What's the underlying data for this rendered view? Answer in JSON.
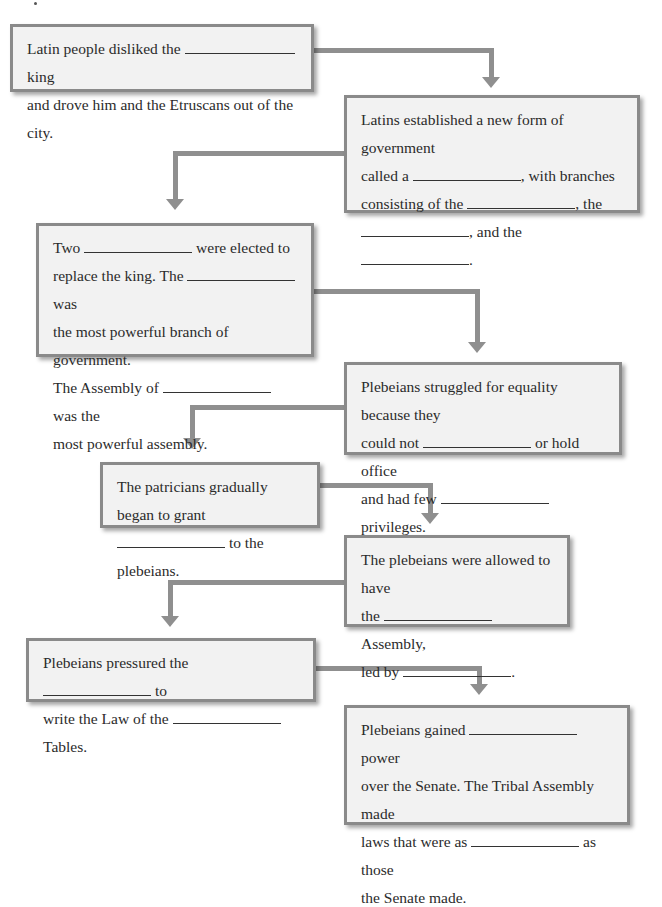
{
  "colors": {
    "box_fill": "#f2f2f2",
    "box_border": "#8a8a8a",
    "connector": "#8f8f8f",
    "text": "#2b2b2b"
  },
  "flowchart": {
    "boxes": [
      {
        "id": 1,
        "segments": [
          {
            "t": "Latin people disliked the "
          },
          {
            "blank": true,
            "w": 110
          },
          {
            "t": " king"
          },
          {
            "br": true
          },
          {
            "t": "and drove him and the Etruscans out of the city."
          }
        ]
      },
      {
        "id": 2,
        "segments": [
          {
            "t": "Latins established a new form of government"
          },
          {
            "br": true
          },
          {
            "t": "called a "
          },
          {
            "blank": true,
            "w": 108
          },
          {
            "t": ", with branches"
          },
          {
            "br": true
          },
          {
            "t": "consisting of the "
          },
          {
            "blank": true,
            "w": 108
          },
          {
            "t": ", the"
          },
          {
            "br": true
          },
          {
            "blank": true,
            "w": 108
          },
          {
            "t": ", and the "
          },
          {
            "blank": true,
            "w": 108
          },
          {
            "t": "."
          }
        ]
      },
      {
        "id": 3,
        "segments": [
          {
            "t": "Two "
          },
          {
            "blank": true,
            "w": 108
          },
          {
            "t": " were elected to"
          },
          {
            "br": true
          },
          {
            "t": "replace the king. The "
          },
          {
            "blank": true,
            "w": 108
          },
          {
            "t": " was"
          },
          {
            "br": true
          },
          {
            "t": "the most powerful branch of government."
          },
          {
            "br": true
          },
          {
            "t": "The Assembly of "
          },
          {
            "blank": true,
            "w": 108
          },
          {
            "t": " was the"
          },
          {
            "br": true
          },
          {
            "t": "most powerful assembly."
          }
        ]
      },
      {
        "id": 4,
        "segments": [
          {
            "t": "Plebeians struggled for equality because they"
          },
          {
            "br": true
          },
          {
            "t": "could not "
          },
          {
            "blank": true,
            "w": 108
          },
          {
            "t": " or hold office"
          },
          {
            "br": true
          },
          {
            "t": "and had few "
          },
          {
            "blank": true,
            "w": 108
          },
          {
            "t": " privileges."
          }
        ]
      },
      {
        "id": 5,
        "segments": [
          {
            "t": "The patricians gradually began to grant"
          },
          {
            "br": true
          },
          {
            "blank": true,
            "w": 108
          },
          {
            "t": " to the plebeians."
          }
        ]
      },
      {
        "id": 6,
        "segments": [
          {
            "t": "The plebeians were allowed to have"
          },
          {
            "br": true
          },
          {
            "t": "the "
          },
          {
            "blank": true,
            "w": 108
          },
          {
            "t": " Assembly,"
          },
          {
            "br": true
          },
          {
            "t": "led by "
          },
          {
            "blank": true,
            "w": 108
          },
          {
            "t": "."
          }
        ]
      },
      {
        "id": 7,
        "segments": [
          {
            "t": "Plebeians pressured the "
          },
          {
            "blank": true,
            "w": 108
          },
          {
            "t": " to"
          },
          {
            "br": true
          },
          {
            "t": "write the Law of the "
          },
          {
            "blank": true,
            "w": 108
          },
          {
            "t": " Tables."
          }
        ]
      },
      {
        "id": 8,
        "segments": [
          {
            "t": "Plebeians gained "
          },
          {
            "blank": true,
            "w": 108
          },
          {
            "t": " power"
          },
          {
            "br": true
          },
          {
            "t": "over the Senate. The Tribal Assembly made"
          },
          {
            "br": true
          },
          {
            "t": "laws that were as "
          },
          {
            "blank": true,
            "w": 108
          },
          {
            "t": " as those"
          },
          {
            "br": true
          },
          {
            "t": "the Senate made."
          }
        ]
      }
    ]
  }
}
